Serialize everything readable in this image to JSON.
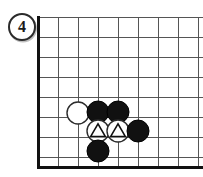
{
  "diagram": {
    "kind": "go-board-corner-diagram",
    "width": 203,
    "height": 177,
    "background_color": "#ffffff",
    "move_badge": {
      "label": "4",
      "shape": "circled-number",
      "text_color": "#1a1a1a",
      "ring_color": "#2b2b2b",
      "fill_color": "#ffffff",
      "cx": 22,
      "cy": 27,
      "r": 14
    },
    "board": {
      "line_color": "#555555",
      "edge_color": "#111111",
      "line_width": 1,
      "edge_width": 3,
      "cell_size": 20,
      "origin_x": 38,
      "origin_y": 17,
      "vertical_lines_x": [
        38,
        58,
        78,
        98,
        118,
        138,
        158,
        178,
        198
      ],
      "horizontal_lines_y": [
        17,
        37,
        57,
        77,
        97,
        117,
        137,
        157
      ],
      "left_edge_x": 38,
      "bottom_edge_y": 167,
      "top_line_y": 17,
      "right_clipped": true,
      "star_points": []
    },
    "stones": [
      {
        "id": "w1",
        "color": "white",
        "cx": 78,
        "cy": 113,
        "r": 11,
        "mark": "none"
      },
      {
        "id": "b1",
        "color": "black",
        "cx": 98,
        "cy": 112,
        "r": 11,
        "mark": "none"
      },
      {
        "id": "b2",
        "color": "black",
        "cx": 118,
        "cy": 112,
        "r": 11,
        "mark": "none"
      },
      {
        "id": "w2",
        "color": "white",
        "cx": 98,
        "cy": 131,
        "r": 11,
        "mark": "triangle"
      },
      {
        "id": "w3",
        "color": "white",
        "cx": 118,
        "cy": 131,
        "r": 11,
        "mark": "triangle"
      },
      {
        "id": "b3",
        "color": "black",
        "cx": 138,
        "cy": 131,
        "r": 11,
        "mark": "none"
      },
      {
        "id": "b4",
        "color": "black",
        "cx": 98,
        "cy": 151,
        "r": 11,
        "mark": "none"
      }
    ],
    "colors": {
      "black_stone_fill": "#111111",
      "black_stone_stroke": "#000000",
      "white_stone_fill": "#ffffff",
      "white_stone_stroke": "#2b2b2b",
      "triangle_mark_color": "#111111",
      "grid_line": "#555555",
      "board_edge": "#111111"
    }
  }
}
